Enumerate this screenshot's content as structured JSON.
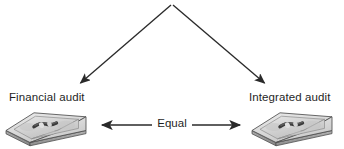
{
  "diagram": {
    "type": "relationship-diagram",
    "width": 344,
    "height": 149,
    "background_color": "#ffffff",
    "stroke_color": "#2a2a2a",
    "text_color": "#1f1f1f",
    "top_clipped_text": "",
    "branch": {
      "apex_x": 172,
      "apex_y": 4,
      "left_end_x": 78,
      "left_end_y": 85,
      "right_end_x": 267,
      "right_end_y": 85,
      "arrowheads": "both-ends-down"
    },
    "nodes": [
      {
        "id": "financial-audit",
        "label": "Financial audit",
        "icon": "money-stack-tray-icon",
        "x": 9,
        "y": 91
      },
      {
        "id": "integrated-audit",
        "label": "Integrated audit",
        "icon": "money-stack-tray-icon",
        "x": 249,
        "y": 91
      }
    ],
    "relation": {
      "label": "Equal",
      "from": "financial-audit",
      "to": "integrated-audit",
      "arrow_style": "double-headed",
      "left_x": 99,
      "right_x": 243,
      "y": 125
    },
    "icon_colors": {
      "tray_top_light": "#e2e2e2",
      "tray_top_mid": "#cfcfcf",
      "tray_rim": "#b4b4b4",
      "tray_side": "#9a9a9a",
      "tray_side_dark": "#8a8a8a",
      "tray_outline": "#4a4a4a",
      "bill_dark": "#3c3c3c",
      "bill_mid": "#6e6e6e"
    }
  }
}
